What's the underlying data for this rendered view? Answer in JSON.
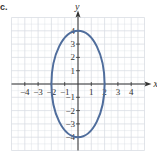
{
  "problem_label": "c.",
  "chart_data": {
    "type": "line",
    "title": "",
    "xlabel": "x",
    "ylabel": "y",
    "xlim": [
      -5,
      5
    ],
    "ylim": [
      -5,
      5
    ],
    "grid": true,
    "x_ticks": [
      -4,
      -3,
      -2,
      -1,
      1,
      2,
      3,
      4
    ],
    "y_ticks": [
      -4,
      -3,
      -2,
      -1,
      1,
      2,
      3,
      4
    ],
    "x_tick_labels": [
      "-4",
      "-3",
      "-2",
      "-1",
      "1",
      "2",
      "3",
      "4"
    ],
    "y_tick_labels": [
      "-4",
      "-3",
      "-2",
      "-1",
      "1",
      "2",
      "3",
      "4"
    ],
    "series": [
      {
        "name": "ellipse",
        "shape": "ellipse",
        "center": [
          0,
          0
        ],
        "semi_axis_x": 2,
        "semi_axis_y": 4,
        "equation": "x^2/4 + y^2/16 = 1",
        "color": "#4f6d9c"
      }
    ]
  },
  "colors": {
    "grid": "#d9dde3",
    "axis": "#333333",
    "curve": "#4f6d9c"
  }
}
